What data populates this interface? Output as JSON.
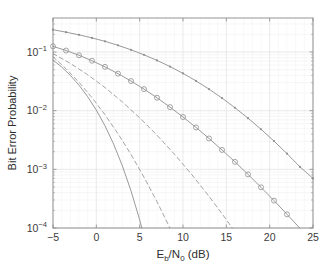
{
  "figure": {
    "background": "#ffffff",
    "axes_color": "#8a8a8a",
    "grid_color": "#e3e3e3",
    "curve_color": "#8f8f8f"
  },
  "chart_data": {
    "type": "line",
    "title": "",
    "xlabel": "E_b/N_0 (dB)",
    "xlabel_parts": {
      "e": "E",
      "b": "b",
      "slash": "/",
      "n": "N",
      "zero": "0",
      "unit": "(dB)"
    },
    "ylabel": "Bit Error Probability",
    "xlim": [
      -5,
      25
    ],
    "ylim": [
      0.0001,
      0.38
    ],
    "yscale": "log",
    "xscale": "linear",
    "grid": true,
    "grid_minor": true,
    "legend": "none",
    "xticks": [
      -5,
      0,
      5,
      10,
      15,
      20,
      25
    ],
    "xticklabels": [
      "-5",
      "0",
      "5",
      "10",
      "15",
      "20",
      "25"
    ],
    "yticks": [
      0.1,
      0.01,
      0.001,
      0.0001
    ],
    "yticklabels": [
      "10^-1",
      "10^-2",
      "10^-3",
      "10^-4"
    ],
    "yticklabel_parts": [
      {
        "base": "10",
        "exp": "-1"
      },
      {
        "base": "10",
        "exp": "-2"
      },
      {
        "base": "10",
        "exp": "-3"
      },
      {
        "base": "10",
        "exp": "-4"
      }
    ],
    "series": [
      {
        "name": "curve-1-solid-dot-markers",
        "style": "solid",
        "marker": "dot",
        "color": "#8f8f8f",
        "x": [
          -5,
          -3.5,
          -2,
          -0.5,
          1,
          2.5,
          4,
          5.5,
          7,
          8.5,
          10,
          11.5,
          13,
          14.5,
          16,
          17.5,
          19,
          20.5,
          22,
          23.5,
          25
        ],
        "y": [
          0.24,
          0.218,
          0.196,
          0.174,
          0.152,
          0.13,
          0.109,
          0.0895,
          0.072,
          0.0565,
          0.0432,
          0.0322,
          0.0233,
          0.0164,
          0.0112,
          0.00745,
          0.00482,
          0.00303,
          0.00185,
          0.0011,
          0.0007
        ]
      },
      {
        "name": "curve-2-solid-circle-markers",
        "style": "solid",
        "marker": "circle",
        "color": "#8f8f8f",
        "x": [
          -5,
          -3.5,
          -2,
          -0.5,
          1,
          2.5,
          4,
          5.5,
          7,
          8.5,
          10,
          11.5,
          13,
          14.5,
          16,
          17.5,
          19,
          20.5,
          22,
          23.5,
          25
        ],
        "y": [
          0.125,
          0.106,
          0.088,
          0.071,
          0.0558,
          0.0428,
          0.032,
          0.0233,
          0.0166,
          0.0115,
          0.0078,
          0.00518,
          0.00336,
          0.00214,
          0.00134,
          0.00082,
          0.000494,
          0.000293,
          0.000171,
          9.85e-05,
          5.6e-05
        ]
      },
      {
        "name": "curve-3-dashed-upper",
        "style": "dashed",
        "marker": "none",
        "color": "#9a9a9a",
        "x": [
          -5,
          -3,
          -1,
          1,
          3,
          5,
          7,
          9,
          11,
          13,
          15,
          17,
          19
        ],
        "y": [
          0.094,
          0.064,
          0.041,
          0.0248,
          0.0141,
          0.00755,
          0.00382,
          0.00182,
          0.000818,
          0.000347,
          0.000139,
          5.27e-05,
          1.89e-05
        ]
      },
      {
        "name": "curve-4-dashed-lower",
        "style": "dashed",
        "marker": "none",
        "color": "#9a9a9a",
        "x": [
          -5,
          -3.5,
          -2,
          -0.5,
          1,
          2.5,
          4,
          5.5,
          7,
          8.5,
          10,
          11.5,
          13
        ],
        "y": [
          0.083,
          0.052,
          0.0305,
          0.0167,
          0.00852,
          0.00405,
          0.00179,
          0.000736,
          0.000281,
          9.96e-05,
          3.28e-05,
          1e-05,
          2.8e-06
        ]
      },
      {
        "name": "curve-5-solid-steep",
        "style": "solid",
        "marker": "none",
        "color": "#8f8f8f",
        "x": [
          -5,
          -4,
          -3,
          -2,
          -1,
          0,
          1,
          2,
          3,
          4,
          5,
          6,
          6.8
        ],
        "y": [
          0.073,
          0.0555,
          0.04,
          0.0272,
          0.0173,
          0.0102,
          0.00552,
          0.00268,
          0.00115,
          0.00043,
          0.000138,
          3.8e-05,
          1.3e-05
        ]
      }
    ]
  }
}
